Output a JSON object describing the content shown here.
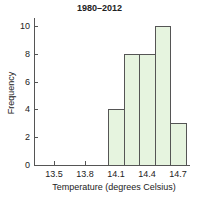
{
  "chart_data": {
    "type": "bar",
    "title": "1980–2012",
    "xlabel": "Temperature (degrees Celsius)",
    "ylabel": "Frequency",
    "categories": [
      "14.1",
      "14.25",
      "14.4",
      "14.55",
      "14.7"
    ],
    "values": [
      4,
      8,
      8,
      10,
      3
    ],
    "x_ticks": [
      "13.5",
      "13.8",
      "14.1",
      "14.4",
      "14.7"
    ],
    "y_ticks": [
      "0",
      "2",
      "4",
      "6",
      "8",
      "10"
    ],
    "ylim": [
      0,
      10.5
    ],
    "xlim": [
      13.3,
      14.8
    ],
    "bin_width": 0.15,
    "grid": false,
    "bar_color": "#e6f4df",
    "edge_color": "#555555"
  }
}
